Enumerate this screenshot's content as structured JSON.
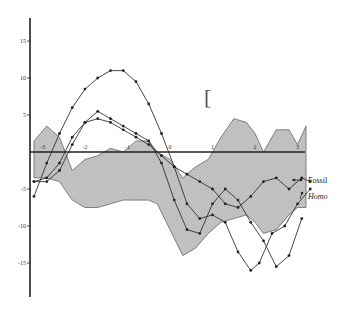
{
  "chart_data": {
    "type": "line",
    "title": "",
    "xlabel": "",
    "ylabel": "",
    "xlim": [
      -3.3,
      3.5
    ],
    "ylim": [
      -18,
      18
    ],
    "grid": false,
    "y_ticks": [
      15,
      10,
      5,
      -5,
      -10,
      -15
    ],
    "y_tick_labels": [
      "15",
      "10",
      "5",
      "-5",
      "-10",
      "-15"
    ],
    "x_ticks": [
      -3,
      -2,
      -1,
      0,
      1,
      2,
      3
    ],
    "x_tick_labels": [
      "-3",
      "-2",
      "-1",
      "0",
      "1",
      "2",
      "3"
    ],
    "legend": {
      "position": "right",
      "entries": [
        "Fossil",
        "Homo"
      ]
    },
    "annotations": [
      "["
    ],
    "band": {
      "name": "shaded range",
      "x_upper": [
        -3.2,
        -2.9,
        -2.6,
        -2.3,
        -2.0,
        -1.7,
        -1.4,
        -1.1,
        -0.8,
        -0.5,
        -0.3,
        0.0,
        0.3,
        0.6,
        0.9,
        1.2,
        1.5,
        1.8,
        2.0,
        2.2,
        2.5,
        2.8,
        3.0,
        3.2
      ],
      "upper": [
        1.5,
        3.5,
        2.0,
        -2.5,
        -1.0,
        -0.5,
        0.5,
        0.0,
        1.5,
        1.5,
        0.0,
        -1.0,
        -3.5,
        -2.0,
        -1.0,
        2.0,
        4.5,
        4.0,
        2.5,
        0.0,
        3.0,
        3.0,
        1.0,
        3.5
      ],
      "lower": [
        -3.5,
        -3.5,
        -4.0,
        -6.5,
        -7.5,
        -7.5,
        -7.0,
        -6.5,
        -6.5,
        -6.5,
        -7.0,
        -10.5,
        -14.0,
        -13.0,
        -11.0,
        -9.5,
        -9.0,
        -8.5,
        -9.5,
        -11.0,
        -10.5,
        -8.5,
        -7.5,
        -7.5
      ]
    },
    "series": [
      {
        "name": "Fossil",
        "x": [
          -3.2,
          -2.9,
          -2.6,
          -2.3,
          -2.0,
          -1.7,
          -1.4,
          -1.1,
          -0.8,
          -0.5,
          -0.2,
          0.1,
          0.4,
          0.7,
          1.0,
          1.3,
          1.6,
          1.9,
          2.2,
          2.5,
          2.8,
          3.1,
          3.3
        ],
        "values": [
          -4.0,
          -3.5,
          -1.5,
          2.0,
          4.0,
          4.5,
          4.0,
          3.0,
          2.0,
          1.0,
          -0.5,
          -2.0,
          -3.0,
          -4.0,
          -5.0,
          -7.0,
          -7.5,
          -6.0,
          -4.0,
          -3.5,
          -5.0,
          -3.5,
          -4.0
        ]
      },
      {
        "name": "Homo",
        "x": [
          -3.2,
          -2.9,
          -2.6,
          -2.3,
          -2.0,
          -1.7,
          -1.4,
          -1.1,
          -0.8,
          -0.5,
          -0.2,
          0.1,
          0.4,
          0.7,
          1.0,
          1.3,
          1.6,
          1.9,
          2.1,
          2.4,
          2.7,
          3.0,
          3.3
        ],
        "values": [
          -6.0,
          -1.5,
          2.5,
          6.0,
          8.5,
          10.0,
          11.0,
          11.0,
          9.5,
          6.5,
          2.5,
          -2.0,
          -7.0,
          -9.0,
          -8.5,
          -9.5,
          -13.5,
          -16.0,
          -15.0,
          -11.0,
          -10.0,
          -7.0,
          -5.0
        ]
      },
      {
        "name": "third curve",
        "x": [
          -3.2,
          -2.9,
          -2.6,
          -2.3,
          -2.0,
          -1.7,
          -1.4,
          -1.1,
          -0.8,
          -0.5,
          -0.2,
          0.1,
          0.4,
          0.7,
          1.0,
          1.3,
          1.6,
          1.9,
          2.2,
          2.5,
          2.8,
          3.1
        ],
        "values": [
          -4.0,
          -4.0,
          -2.5,
          1.0,
          4.0,
          5.5,
          4.5,
          3.5,
          2.5,
          1.5,
          -1.5,
          -6.5,
          -10.5,
          -11.0,
          -7.0,
          -5.0,
          -6.5,
          -9.5,
          -12.0,
          -15.5,
          -14.0,
          -9.0
        ]
      }
    ]
  },
  "legend": {
    "fossil": "Fossil",
    "homo": "Homo"
  },
  "axis": {
    "y_labels": [
      "15",
      "10",
      "5",
      "-5",
      "-10",
      "-15"
    ],
    "x_labels": [
      "-3",
      "-2",
      "-1",
      "0",
      "1",
      "2",
      "3"
    ]
  },
  "annotation": {
    "bracket": "["
  },
  "colors": {
    "band_fill": "#c6c6c6",
    "line": "#333333",
    "axis": "#222222"
  }
}
